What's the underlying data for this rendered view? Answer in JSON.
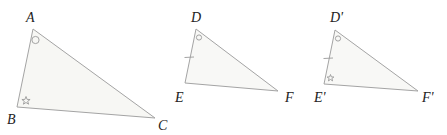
{
  "diagram": {
    "type": "congruent-triangles",
    "colors": {
      "stroke": "#a4a4a4",
      "fill": "#f7f7f4",
      "label": "#222222"
    },
    "triangles": [
      {
        "id": "ABC",
        "vertices": {
          "A": {
            "label": "A",
            "x": 33,
            "y": 29,
            "lx": 26,
            "ly": 22
          },
          "B": {
            "label": "B",
            "x": 17,
            "y": 107,
            "lx": 8,
            "ly": 123
          },
          "C": {
            "label": "C",
            "x": 155,
            "y": 118,
            "lx": 158,
            "ly": 130
          }
        },
        "angle_marks": [
          {
            "vertex": "A",
            "symbol": "circle"
          },
          {
            "vertex": "B",
            "symbol": "star"
          }
        ],
        "side_ticks": []
      },
      {
        "id": "DEF",
        "vertices": {
          "D": {
            "label": "D",
            "x": 196,
            "y": 29,
            "lx": 192,
            "ly": 22
          },
          "E": {
            "label": "E",
            "x": 185,
            "y": 83,
            "lx": 176,
            "ly": 101
          },
          "F": {
            "label": "F",
            "x": 278,
            "y": 91,
            "lx": 285,
            "ly": 101
          }
        },
        "angle_marks": [
          {
            "vertex": "D",
            "symbol": "circle"
          }
        ],
        "side_ticks": [
          {
            "side": "DE",
            "count": 1
          }
        ]
      },
      {
        "id": "D'E'F'",
        "vertices": {
          "D'": {
            "label": "D'",
            "x": 335,
            "y": 30,
            "lx": 331,
            "ly": 22
          },
          "E'": {
            "label": "E'",
            "x": 324,
            "y": 84,
            "lx": 315,
            "ly": 101
          },
          "F'": {
            "label": "F'",
            "x": 418,
            "y": 91,
            "lx": 422,
            "ly": 101
          }
        },
        "angle_marks": [
          {
            "vertex": "D'",
            "symbol": "circle"
          },
          {
            "vertex": "E'",
            "symbol": "star"
          }
        ],
        "side_ticks": [
          {
            "side": "D'E'",
            "count": 1
          }
        ]
      }
    ]
  }
}
